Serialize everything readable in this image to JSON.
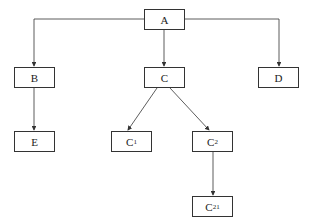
{
  "diagram": {
    "type": "tree",
    "nodes": {
      "A": {
        "label": "A",
        "sub": ""
      },
      "B": {
        "label": "B",
        "sub": ""
      },
      "C": {
        "label": "C",
        "sub": ""
      },
      "D": {
        "label": "D",
        "sub": ""
      },
      "E": {
        "label": "E",
        "sub": ""
      },
      "C1": {
        "label": "C",
        "sub": "1"
      },
      "C2": {
        "label": "C",
        "sub": "2"
      },
      "C21": {
        "label": "C",
        "sub": "21"
      }
    },
    "edges": [
      [
        "A",
        "B"
      ],
      [
        "A",
        "C"
      ],
      [
        "A",
        "D"
      ],
      [
        "B",
        "E"
      ],
      [
        "C",
        "C1"
      ],
      [
        "C",
        "C2"
      ],
      [
        "C2",
        "C21"
      ]
    ],
    "colors": {
      "line": "#333333",
      "background": "#ffffff"
    }
  }
}
